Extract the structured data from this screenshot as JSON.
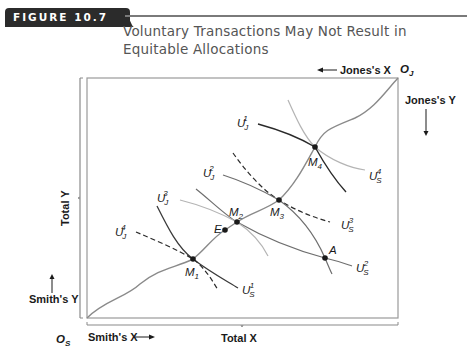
{
  "figure": {
    "number_label": "FIGURE 10.7",
    "title_line1": "Voluntary Transactions May Not Result in",
    "title_line2": "Equitable Allocations"
  },
  "axes": {
    "total_x": "Total X",
    "total_y": "Total Y",
    "smiths_x": "Smith's X",
    "smiths_y": "Smith's Y",
    "jones_x": "Jones's X",
    "jones_y": "Jones's Y",
    "origin_smith": {
      "base": "O",
      "sub": "S"
    },
    "origin_jones": {
      "base": "O",
      "sub": "J"
    }
  },
  "points": [
    {
      "id": "M1",
      "base": "M",
      "sub": "1"
    },
    {
      "id": "E",
      "base": "E",
      "sub": ""
    },
    {
      "id": "M2",
      "base": "M",
      "sub": "2"
    },
    {
      "id": "M3",
      "base": "M",
      "sub": "3"
    },
    {
      "id": "M4",
      "base": "M",
      "sub": "4"
    },
    {
      "id": "A",
      "base": "A",
      "sub": ""
    }
  ],
  "curves": {
    "smith": [
      {
        "id": "US1",
        "base": "U",
        "sub": "S",
        "sup": "1"
      },
      {
        "id": "US2",
        "base": "U",
        "sub": "S",
        "sup": "2"
      },
      {
        "id": "US3",
        "base": "U",
        "sub": "S",
        "sup": "3"
      },
      {
        "id": "US4",
        "base": "U",
        "sub": "S",
        "sup": "4"
      }
    ],
    "jones": [
      {
        "id": "UJ1",
        "base": "U",
        "sub": "J",
        "sup": "1"
      },
      {
        "id": "UJ2",
        "base": "U",
        "sub": "J",
        "sup": "2"
      },
      {
        "id": "UJ3",
        "base": "U",
        "sub": "J",
        "sup": "3"
      },
      {
        "id": "UJ4",
        "base": "U",
        "sub": "J",
        "sup": "4"
      }
    ],
    "contract_curve": "O_S to O_J through M1, E, M2, M3, M4"
  },
  "colors": {
    "badge": "#2b2b2b",
    "title": "#555555",
    "box": "#9a9a9a",
    "contract_curve": "#8a8a8a",
    "dark_curve": "#2a2a2a",
    "light_curve": "#b4b4b4",
    "mid_curve": "#6e6e6e"
  }
}
